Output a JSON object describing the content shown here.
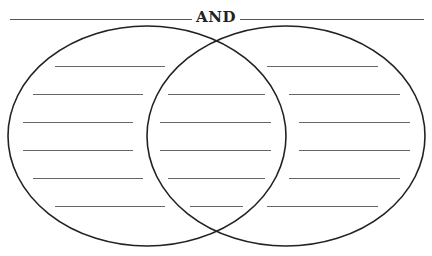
{
  "title": {
    "left_blank": "",
    "connector": "AND",
    "right_blank": ""
  },
  "venn": {
    "left_circle": {
      "cx": 147,
      "cy": 136,
      "rx": 139,
      "ry": 110
    },
    "right_circle": {
      "cx": 286,
      "cy": 136,
      "rx": 139,
      "ry": 110
    },
    "stroke_color": "#222222",
    "line_color": "#666666",
    "left_lines": [
      {
        "y": 66,
        "x1": 55,
        "x2": 165
      },
      {
        "y": 94,
        "x1": 33,
        "x2": 143
      },
      {
        "y": 122,
        "x1": 23,
        "x2": 133
      },
      {
        "y": 150,
        "x1": 23,
        "x2": 133
      },
      {
        "y": 178,
        "x1": 33,
        "x2": 143
      },
      {
        "y": 206,
        "x1": 55,
        "x2": 165
      }
    ],
    "middle_lines": [
      {
        "y": 94,
        "x1": 168,
        "x2": 265
      },
      {
        "y": 122,
        "x1": 160,
        "x2": 271
      },
      {
        "y": 150,
        "x1": 160,
        "x2": 271
      },
      {
        "y": 178,
        "x1": 168,
        "x2": 265
      },
      {
        "y": 206,
        "x1": 190,
        "x2": 243
      }
    ],
    "right_lines": [
      {
        "y": 66,
        "x1": 267,
        "x2": 378
      },
      {
        "y": 94,
        "x1": 289,
        "x2": 400
      },
      {
        "y": 122,
        "x1": 299,
        "x2": 410
      },
      {
        "y": 150,
        "x1": 299,
        "x2": 410
      },
      {
        "y": 178,
        "x1": 289,
        "x2": 400
      },
      {
        "y": 206,
        "x1": 267,
        "x2": 378
      }
    ]
  }
}
